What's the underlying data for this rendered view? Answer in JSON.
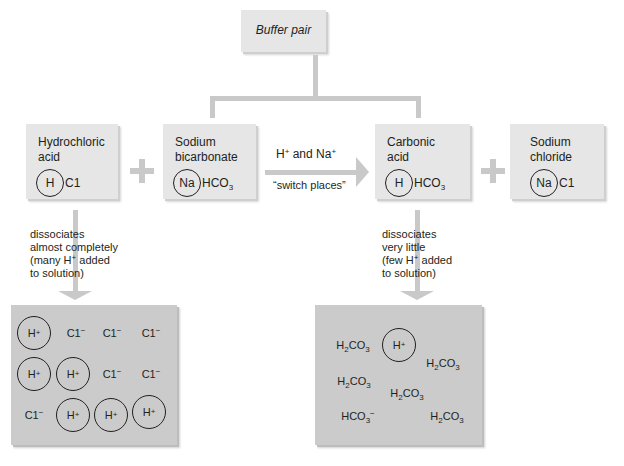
{
  "top": {
    "title": "Buffer pair"
  },
  "reactants": [
    {
      "name_line1": "Hydrochloric",
      "name_line2": "acid",
      "circled": "H",
      "rest": "C1",
      "rest_sub": ""
    },
    {
      "name_line1": "Sodium",
      "name_line2": "bicarbonate",
      "circled": "Na",
      "rest": "HCO",
      "rest_sub": "3"
    }
  ],
  "products": [
    {
      "name_line1": "Carbonic",
      "name_line2": "acid",
      "circled": "H",
      "rest": "HCO",
      "rest_sub": "3"
    },
    {
      "name_line1": "Sodium",
      "name_line2": "chloride",
      "circled": "Na",
      "rest": "C1",
      "rest_sub": ""
    }
  ],
  "exchange": {
    "line1_a": "H",
    "line1_a_sup": "+",
    "line1_mid": " and Na",
    "line1_b_sup": "+",
    "line2": "“switch places”"
  },
  "left_note": [
    "dissociates",
    "almost completely",
    "(many H",
    "+",
    " added",
    "to solution)"
  ],
  "right_note": [
    "dissociates",
    "very little",
    "(few H",
    "+",
    " added",
    "to solution)"
  ],
  "left_solution": {
    "h_ion": "H",
    "h_sup": "+",
    "cl_ion": "C1",
    "cl_sup": "−",
    "grid": [
      [
        "H+",
        "Cl-",
        "Cl-",
        "Cl-"
      ],
      [
        "H+",
        "H+",
        "Cl-",
        "Cl-"
      ],
      [
        "Cl-",
        "H+",
        "H+",
        "H+"
      ]
    ]
  },
  "right_solution": {
    "h2co3_a": "H",
    "h2co3_sub": "2",
    "h2co3_b": "CO",
    "h2co3_sub2": "3",
    "hco3": "HCO",
    "hco3_sub": "3",
    "hco3_sup": "−",
    "h_ion": "H",
    "h_sup": "+"
  }
}
